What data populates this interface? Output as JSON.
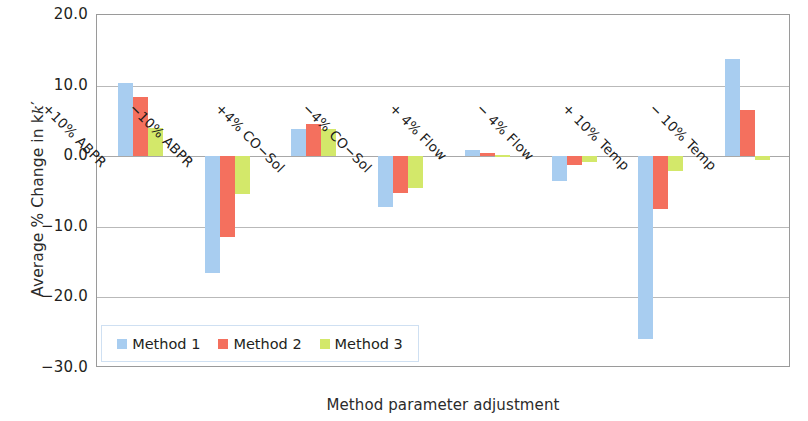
{
  "chart_data": {
    "type": "bar",
    "title": "",
    "xlabel": "Method parameter adjustment",
    "ylabel": "Average % Change in k'",
    "ylim": [
      -30.0,
      20.0
    ],
    "ytick_labels": [
      "20.0",
      "10.0",
      "0.0",
      "-10.0",
      "-20.0",
      "-30.0"
    ],
    "ytick_values": [
      20.0,
      10.0,
      0.0,
      -10.0,
      -20.0,
      -30.0
    ],
    "grid": true,
    "legend_position": "inside-bottom-left",
    "categories": [
      "+10% ABPR",
      "−10% ABPR",
      "+4% CO−Sol",
      "−4% CO−Sol",
      "+ 4% Flow",
      "− 4% Flow",
      "+ 10% Temp",
      "− 10% Temp"
    ],
    "series": [
      {
        "name": "Method 1",
        "color": "#a8cdf0",
        "values": [
          10.3,
          -16.6,
          3.8,
          -7.2,
          0.9,
          -3.5,
          -25.9,
          13.8
        ]
      },
      {
        "name": "Method 2",
        "color": "#f4705e",
        "values": [
          8.4,
          -11.5,
          4.5,
          -5.2,
          0.5,
          -1.3,
          -7.5,
          6.5
        ]
      },
      {
        "name": "Method 3",
        "color": "#d3e86a",
        "values": [
          4.0,
          -5.4,
          3.9,
          -4.5,
          0.1,
          -0.8,
          -2.1,
          -0.6
        ]
      }
    ]
  },
  "legend": {
    "items": [
      {
        "label": "Method 1",
        "color": "#a8cdf0"
      },
      {
        "label": "Method 2",
        "color": "#f4705e"
      },
      {
        "label": "Method 3",
        "color": "#d3e86a"
      }
    ]
  },
  "axes": {
    "y_title": "Average % Change in k",
    "y_title_prime": "′",
    "x_title": "Method parameter adjustment"
  }
}
